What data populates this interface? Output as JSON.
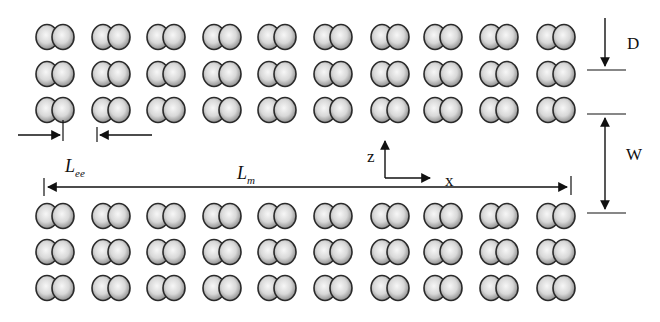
{
  "diagram": {
    "type": "electrode-pair-array-schematic",
    "arrays": [
      {
        "name": "top-array",
        "rows": 3,
        "columns": 10,
        "row_y": [
          37,
          74,
          110
        ]
      },
      {
        "name": "bottom-array",
        "rows": 3,
        "columns": 10,
        "row_y": [
          216,
          252,
          288
        ]
      }
    ],
    "column_x": [
      55,
      111,
      166,
      222,
      277,
      333,
      390,
      443,
      499,
      556
    ],
    "element": "overlapping-sphere-pair",
    "colors": {
      "sphere_fill_center": "#f4f4f4",
      "sphere_fill_edge": "#8a8a8a",
      "sphere_outline": "#2a2a2a",
      "line": "#111111",
      "background": "#ffffff"
    }
  },
  "labels": {
    "D": "D",
    "W": "W",
    "L_ee_main": "L",
    "L_ee_sub": "ee",
    "L_m_main": "L",
    "L_m_sub": "m",
    "axis_z": "z",
    "axis_x": "x"
  }
}
